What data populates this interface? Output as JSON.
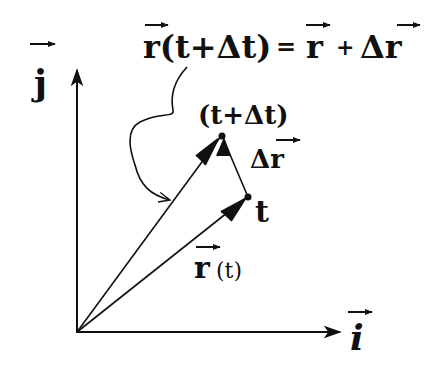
{
  "diagram": {
    "title_equation": {
      "lhs": "r(t+Δt)",
      "eq": "=",
      "rhs_r": "r",
      "plus": "+",
      "rhs_dr": "Δr",
      "full": "r⃗(t+Δt) = r⃗ + Δr⃗"
    },
    "axes": {
      "y_label": "j",
      "x_label": "i"
    },
    "vectors": {
      "r_t": {
        "label_r": "r",
        "label_arg": "(t)"
      },
      "r_t_dt": {
        "point_label": "(t+Δt)"
      },
      "delta_r": {
        "label": "Δr"
      }
    },
    "points": {
      "t": "t",
      "t_dt": "(t+Δt)"
    },
    "colors": {
      "ink": "#111111",
      "background": "#ffffff"
    }
  }
}
